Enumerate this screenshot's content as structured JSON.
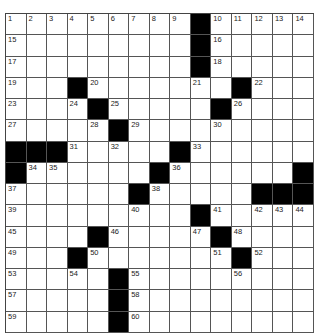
{
  "puzzle": {
    "rows": 15,
    "cols": 15,
    "colors": {
      "block": "#000000",
      "cell": "#ffffff",
      "line": "#555555"
    },
    "grid": [
      "1,2,3,4,5,6,7,8,9,#,10,11,12,13,14",
      "15,.,.,.,.,.,.,.,.,#,16,.,.,.,.",
      "17,.,.,.,.,.,.,.,.,#,18,.,.,.,.",
      "19,.,.,#,20,.,.,.,.,21,.,#,22,.,.",
      "23,.,.,24,#,25,.,.,.,.,#,26,.,.,.",
      "27,.,.,.,28,#,29,.,.,.,30,.,.,.,.",
      "#,#,#,31,.,32,.,.,#,33,.,.,.,.,.",
      "#,34,35,.,.,.,.,#,36,.,.,.,.,.,#",
      "37,.,.,.,.,.,#,38,.,.,.,.,#,#,#",
      "39,.,.,.,.,.,40,.,.,#,41,.,42,43,44",
      "45,.,.,.,#,46,.,.,.,47,#,48,.,.,.",
      "49,.,.,#,50,.,.,.,.,.,51,#,52,.,.",
      "53,.,.,54,.,#,55,.,.,.,.,56,.,.,.",
      "57,.,.,.,.,#,58,.,.,.,.,.,.,.,.",
      "59,.,.,.,.,#,60,.,.,.,.,.,.,.,."
    ]
  }
}
